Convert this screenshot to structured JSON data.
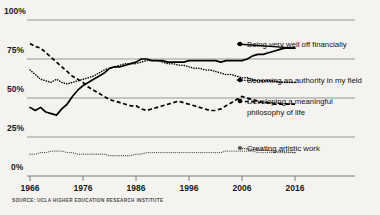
{
  "source": "SOURCE: UCLA HIGHER EDUCATION RESEARCH INSTITUTE",
  "axis": {
    "y_ticks": [
      "0%",
      "25%",
      "50%",
      "75%",
      "100%"
    ],
    "x_ticks": [
      "1966",
      "1976",
      "1986",
      "1996",
      "2006",
      "2016"
    ]
  },
  "legend": {
    "items": [
      {
        "label": "Being very well off financially",
        "style": "solid"
      },
      {
        "label": "Becoming an authority in my field",
        "style": "dotted"
      },
      {
        "label": "Developing a meaningful",
        "label2": "philosophy of life",
        "style": "dashed"
      },
      {
        "label": "Creating artistic work",
        "style": "fine-dotted"
      }
    ]
  },
  "chart_data": {
    "type": "line",
    "title": "",
    "subtitle": "",
    "xlabel": "",
    "ylabel": "",
    "xlim": [
      1966,
      2016
    ],
    "ylim": [
      0,
      100
    ],
    "grid": true,
    "legend_position": "right-inline",
    "x_tick_values": [
      1966,
      1976,
      1986,
      1996,
      2006,
      2016
    ],
    "y_tick_values": [
      0,
      25,
      50,
      75,
      100
    ],
    "x": [
      1966,
      1967,
      1968,
      1969,
      1970,
      1971,
      1972,
      1973,
      1974,
      1975,
      1976,
      1977,
      1978,
      1979,
      1980,
      1981,
      1982,
      1983,
      1984,
      1985,
      1986,
      1987,
      1988,
      1989,
      1990,
      1991,
      1992,
      1993,
      1994,
      1995,
      1996,
      1997,
      1998,
      1999,
      2000,
      2001,
      2002,
      2003,
      2004,
      2005,
      2006,
      2007,
      2008,
      2009,
      2010,
      2011,
      2012,
      2013,
      2014,
      2015,
      2016
    ],
    "series": [
      {
        "name": "Being very well off financially",
        "style": "solid",
        "values": [
          44,
          42,
          44,
          41,
          40,
          39,
          43,
          46,
          51,
          55,
          58,
          60,
          62,
          64,
          66,
          69,
          70,
          70,
          71,
          72,
          73,
          75,
          75,
          74,
          74,
          74,
          73,
          73,
          73,
          73,
          74,
          74,
          74,
          74,
          74,
          74,
          73,
          74,
          74,
          74,
          74,
          75,
          77,
          78,
          78,
          79,
          80,
          81,
          82,
          82,
          82
        ],
        "endpoint_value": 82
      },
      {
        "name": "Becoming an authority in my field",
        "style": "dotted",
        "values": [
          68,
          65,
          62,
          61,
          60,
          62,
          60,
          59,
          60,
          61,
          62,
          63,
          64,
          66,
          68,
          69,
          70,
          71,
          72,
          72,
          72,
          73,
          74,
          74,
          74,
          73,
          72,
          72,
          71,
          71,
          70,
          69,
          69,
          68,
          68,
          67,
          66,
          65,
          65,
          64,
          63,
          63,
          62,
          61,
          61,
          61,
          61,
          60,
          60,
          60,
          60
        ],
        "endpoint_value": 60
      },
      {
        "name": "Developing a meaningful philosophy of life",
        "style": "dashed",
        "values": [
          85,
          83,
          82,
          79,
          76,
          73,
          70,
          67,
          64,
          62,
          60,
          57,
          55,
          53,
          51,
          49,
          48,
          47,
          46,
          45,
          45,
          43,
          42,
          43,
          44,
          45,
          46,
          47,
          48,
          47,
          46,
          45,
          44,
          43,
          42,
          42,
          43,
          45,
          47,
          49,
          51,
          50,
          49,
          48,
          47,
          47,
          46,
          46,
          46,
          46,
          46
        ],
        "endpoint_value": 46
      },
      {
        "name": "Creating artistic work",
        "style": "fine-dotted",
        "values": [
          14,
          14,
          15,
          15,
          16,
          16,
          16,
          15,
          15,
          14,
          14,
          14,
          14,
          14,
          14,
          13,
          13,
          13,
          13,
          13,
          14,
          14,
          15,
          15,
          15,
          15,
          15,
          15,
          15,
          15,
          15,
          15,
          15,
          15,
          15,
          15,
          15,
          16,
          16,
          16,
          16,
          16,
          16,
          15,
          15,
          15,
          15,
          15,
          15,
          15,
          15
        ],
        "endpoint_value": 15
      }
    ]
  },
  "legend_anchor_labels": {
    "l0": "Being very well off financially",
    "l1": "Becoming an authority in my field",
    "l2a": "Developing a meaningful",
    "l2b": "philosophy of life",
    "l3": "Creating artistic work"
  }
}
